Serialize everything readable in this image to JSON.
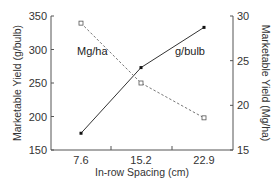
{
  "chart_data": {
    "type": "line",
    "title": "",
    "xlabel": "In-row Spacing (cm)",
    "ylabel": "Marketable Yield (g/bulb)",
    "ylabel_right": "Marketable Yield (Mg/ha)",
    "categories": [
      "7.6",
      "15.2",
      "22.9"
    ],
    "ylim": [
      150,
      350
    ],
    "ylim_right": [
      15,
      30
    ],
    "yticks": [
      150,
      200,
      250,
      300,
      350
    ],
    "yticks_right": [
      15,
      20,
      25,
      30
    ],
    "grid": false,
    "legend": "inline labels",
    "series": [
      {
        "name": "g/bulb",
        "axis": "left",
        "style": "solid",
        "marker": "filled-square",
        "values": [
          175,
          273,
          333
        ]
      },
      {
        "name": "Mg/ha",
        "axis": "right",
        "style": "dashed",
        "marker": "open-square",
        "values": [
          29.2,
          22.5,
          18.6
        ]
      }
    ]
  },
  "labels": {
    "series_gbulb": "g/bulb",
    "series_mgha": "Mg/ha"
  }
}
